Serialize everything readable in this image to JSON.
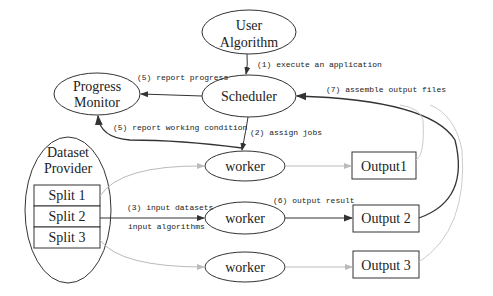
{
  "diagram": {
    "nodes": {
      "user_algorithm": {
        "line1": "User",
        "line2": "Algorithm"
      },
      "scheduler": {
        "label": "Scheduler"
      },
      "progress_monitor": {
        "line1": "Progress",
        "line2": "Monitor"
      },
      "dataset_provider": {
        "line1": "Dataset",
        "line2": "Provider",
        "splits": [
          "Split 1",
          "Split 2",
          "Split 3"
        ]
      },
      "workers": [
        "worker",
        "worker",
        "worker"
      ],
      "outputs": [
        "Output1",
        "Output 2",
        "Output 3"
      ]
    },
    "edges": {
      "execute": "(1) execute an application",
      "assign": "(2) assign jobs",
      "input_datasets": "(3) input datasets",
      "input_algorithms": "input algorithms",
      "report_progress": "(5) report progress",
      "report_working": "(5) report working condition",
      "output_result": "(6) output result",
      "assemble": "(7) assemble output files"
    },
    "colors": {
      "stroke": "#333333",
      "faint_stroke": "#bbbbbb",
      "text": "#222222"
    }
  }
}
